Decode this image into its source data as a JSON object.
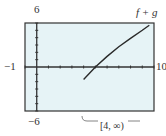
{
  "labels": {
    "ymax": "6",
    "ymin": "−6",
    "xmin": "−1",
    "xmax": "10",
    "function": "f + g",
    "domain": "[4, ∞)"
  },
  "colors": {
    "plot_bg": "#e6f3f6",
    "frame": "#333333",
    "curve": "#2a2a2a"
  },
  "chart_data": {
    "type": "line",
    "title": "",
    "xlabel": "",
    "ylabel": "",
    "xlim": [
      -1,
      10
    ],
    "ylim": [
      -6,
      6
    ],
    "grid": false,
    "x_ticks_step": 1,
    "y_ticks_step": 1,
    "series": [
      {
        "name": "f + g",
        "x": [
          4,
          5,
          6,
          7,
          8,
          9,
          9.6
        ],
        "y": [
          -1.7,
          0,
          1.45,
          2.75,
          3.9,
          5.0,
          5.7
        ]
      }
    ],
    "annotations": [
      "f + g",
      "[4, ∞)"
    ]
  }
}
